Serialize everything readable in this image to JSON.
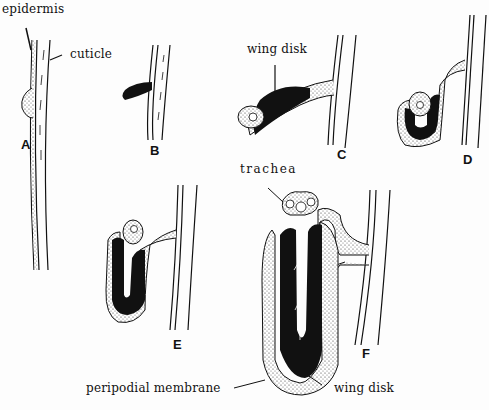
{
  "figure": {
    "labels": {
      "epidermis": "epidermis",
      "cuticle": "cuticle",
      "wing_disk_top": "wing disk",
      "trachea": "trachea",
      "peripodial_membrane": "peripodial membrane",
      "wing_disk_bottom": "wing disk"
    },
    "panels": [
      "A",
      "B",
      "C",
      "D",
      "E",
      "F"
    ],
    "caption_fragment": "F..."
  }
}
